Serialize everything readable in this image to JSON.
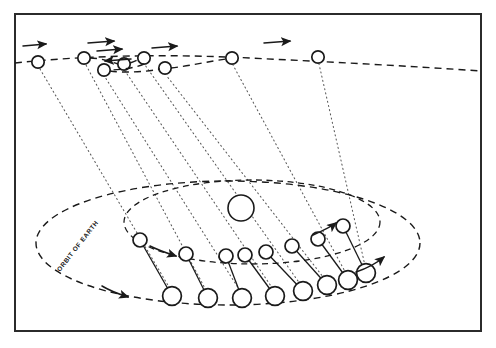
{
  "figure": {
    "domain": "diagram",
    "canvas": {
      "width": 496,
      "height": 348
    },
    "colors": {
      "ink": "#1a1a1a",
      "frame": "#2b2b2b",
      "sight_line": "#5a5a5a",
      "background": "#ffffff"
    },
    "labels": {
      "orbit_of_earth": "ORBIT OF EARTH"
    },
    "frame": {
      "x": 14,
      "y": 13,
      "width": 468,
      "height": 319
    },
    "sun": {
      "cx": 241,
      "cy": 208,
      "r": 13
    },
    "sky_line": {
      "name": "celestial-sphere-background-stars",
      "points": [
        [
          15,
          62
        ],
        [
          120,
          55
        ],
        [
          250,
          58
        ],
        [
          360,
          63
        ],
        [
          481,
          70
        ]
      ]
    },
    "sky_positions": [
      {
        "id": "s1",
        "cx": 38,
        "cy": 62,
        "r": 6.2
      },
      {
        "id": "s2",
        "cx": 84,
        "cy": 58,
        "r": 6.2
      },
      {
        "id": "s3",
        "cx": 104,
        "cy": 70,
        "r": 6.2
      },
      {
        "id": "s4",
        "cx": 124,
        "cy": 64,
        "r": 6.2
      },
      {
        "id": "s5",
        "cx": 144,
        "cy": 58,
        "r": 6.2
      },
      {
        "id": "s6",
        "cx": 165,
        "cy": 68,
        "r": 6.2
      },
      {
        "id": "s7",
        "cx": 232,
        "cy": 58,
        "r": 6.2
      },
      {
        "id": "s8",
        "cx": 318,
        "cy": 57,
        "r": 6.2
      }
    ],
    "sky_arrows": [
      {
        "id": "a1",
        "x1": 22,
        "y1": 46,
        "x2": 48,
        "y2": 44,
        "dir": "right"
      },
      {
        "id": "a2",
        "x1": 88,
        "y1": 44,
        "x2": 118,
        "y2": 42,
        "dir": "right"
      },
      {
        "id": "a3",
        "x1": 96,
        "y1": 50,
        "x2": 126,
        "y2": 48,
        "dir": "right"
      },
      {
        "id": "a4",
        "x1": 130,
        "y1": 60,
        "x2": 102,
        "y2": 62,
        "dir": "left"
      },
      {
        "id": "a5",
        "x1": 150,
        "y1": 48,
        "x2": 180,
        "y2": 46,
        "dir": "right"
      },
      {
        "id": "a6",
        "x1": 262,
        "y1": 43,
        "x2": 292,
        "y2": 41,
        "dir": "right"
      }
    ],
    "earth_orbit": {
      "name": "orbit-of-earth",
      "cx": 228,
      "cy": 243,
      "rx": 192,
      "ry": 62
    },
    "mars_orbit": {
      "name": "orbit-of-mars",
      "cx": 252,
      "cy": 222,
      "rx": 128,
      "ry": 42
    },
    "earth_positions": [
      {
        "id": "e1",
        "cx": 140,
        "cy": 240,
        "r": 7.0
      },
      {
        "id": "e2",
        "cx": 186,
        "cy": 254,
        "r": 7.0
      },
      {
        "id": "e3",
        "cx": 226,
        "cy": 256,
        "r": 7.0
      },
      {
        "id": "e4",
        "cx": 245,
        "cy": 255,
        "r": 7.0
      },
      {
        "id": "e5",
        "cx": 266,
        "cy": 252,
        "r": 7.0
      },
      {
        "id": "e6",
        "cx": 292,
        "cy": 246,
        "r": 7.0
      },
      {
        "id": "e7",
        "cx": 318,
        "cy": 239,
        "r": 7.0
      },
      {
        "id": "e8",
        "cx": 343,
        "cy": 226,
        "r": 7.0
      }
    ],
    "mars_positions": [
      {
        "id": "m1",
        "cx": 172,
        "cy": 296,
        "r": 9.4
      },
      {
        "id": "m2",
        "cx": 208,
        "cy": 298,
        "r": 9.4
      },
      {
        "id": "m3",
        "cx": 242,
        "cy": 298,
        "r": 9.4
      },
      {
        "id": "m4",
        "cx": 275,
        "cy": 296,
        "r": 9.4
      },
      {
        "id": "m5",
        "cx": 303,
        "cy": 291,
        "r": 9.4
      },
      {
        "id": "m6",
        "cx": 327,
        "cy": 285,
        "r": 9.4
      },
      {
        "id": "m7",
        "cx": 348,
        "cy": 280,
        "r": 9.4
      },
      {
        "id": "m8",
        "cx": 366,
        "cy": 273,
        "r": 9.4
      }
    ],
    "link_lines": [
      {
        "id": "l0",
        "x1": 140,
        "y1": 240,
        "x2": 172,
        "y2": 296
      },
      {
        "id": "l1",
        "x1": 186,
        "y1": 254,
        "x2": 208,
        "y2": 298
      },
      {
        "id": "l2",
        "x1": 226,
        "y1": 256,
        "x2": 242,
        "y2": 298
      },
      {
        "id": "l3",
        "x1": 245,
        "y1": 255,
        "x2": 275,
        "y2": 296
      },
      {
        "id": "l4",
        "x1": 266,
        "y1": 252,
        "x2": 303,
        "y2": 291
      },
      {
        "id": "l5",
        "x1": 292,
        "y1": 246,
        "x2": 327,
        "y2": 285
      },
      {
        "id": "l6",
        "x1": 318,
        "y1": 239,
        "x2": 348,
        "y2": 280
      },
      {
        "id": "l7",
        "x1": 343,
        "y1": 226,
        "x2": 366,
        "y2": 273
      }
    ],
    "sight_lines": [
      {
        "id": "v1",
        "x1": 172,
        "y1": 296,
        "x2": 38,
        "y2": 62
      },
      {
        "id": "v2",
        "x1": 208,
        "y1": 298,
        "x2": 84,
        "y2": 58
      },
      {
        "id": "v3",
        "x1": 242,
        "y1": 298,
        "x2": 104,
        "y2": 70
      },
      {
        "id": "v4",
        "x1": 275,
        "y1": 296,
        "x2": 124,
        "y2": 64
      },
      {
        "id": "v5",
        "x1": 303,
        "y1": 291,
        "x2": 144,
        "y2": 58
      },
      {
        "id": "v6",
        "x1": 327,
        "y1": 285,
        "x2": 165,
        "y2": 68
      },
      {
        "id": "v7",
        "x1": 348,
        "y1": 280,
        "x2": 232,
        "y2": 58
      },
      {
        "id": "v8",
        "x1": 366,
        "y1": 273,
        "x2": 318,
        "y2": 57
      }
    ],
    "motion_arrows": [
      {
        "id": "ma-earth",
        "name": "earth-direction-arrow",
        "x1": 100,
        "y1": 288,
        "x2": 130,
        "y2": 296
      },
      {
        "id": "ma-earth-2",
        "name": "earth-direction-arrow-right",
        "x1": 355,
        "y1": 272,
        "x2": 385,
        "y2": 258
      },
      {
        "id": "ma-mars",
        "name": "mars-direction-arrow",
        "x1": 148,
        "y1": 248,
        "x2": 178,
        "y2": 256
      },
      {
        "id": "ma-mars-2",
        "name": "mars-direction-arrow-right",
        "x1": 312,
        "y1": 236,
        "x2": 338,
        "y2": 223
      }
    ],
    "orbit_label_path": {
      "x": 58,
      "y": 268,
      "rotate": -52
    }
  }
}
